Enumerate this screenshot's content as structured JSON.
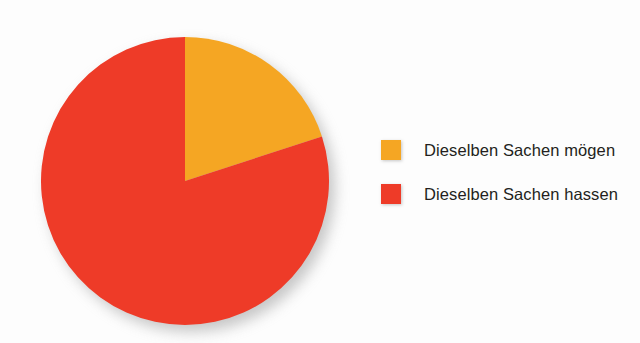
{
  "chart_data": {
    "type": "pie",
    "title": "",
    "subtitle": "",
    "xlabel": "",
    "ylabel": "",
    "grid": false,
    "legend_position": "right",
    "start_angle_deg": 0,
    "direction": "clockwise",
    "categories": [
      "Dieselben Sachen mögen",
      "Dieselben Sachen hassen"
    ],
    "values": [
      20,
      80
    ],
    "unit": "%",
    "colors": [
      "#f5a623",
      "#ee3b28"
    ],
    "slices": [
      {
        "label": "Dieselben Sachen mögen",
        "value": 20,
        "percent": 20,
        "color": "#f5a623",
        "start_angle_deg": 0,
        "end_angle_deg": 72
      },
      {
        "label": "Dieselben Sachen hassen",
        "value": 80,
        "percent": 80,
        "color": "#ee3b28",
        "start_angle_deg": 72,
        "end_angle_deg": 360
      }
    ]
  },
  "legend": {
    "items": [
      {
        "label": "Dieselben Sachen mögen",
        "color": "#f5a623",
        "swatch_name": "legend-swatch-moegen"
      },
      {
        "label": "Dieselben Sachen hassen",
        "color": "#ee3b28",
        "swatch_name": "legend-swatch-hassen"
      }
    ]
  },
  "canvas": {
    "background": "#fdfdfd",
    "width": 640,
    "height": 343
  }
}
